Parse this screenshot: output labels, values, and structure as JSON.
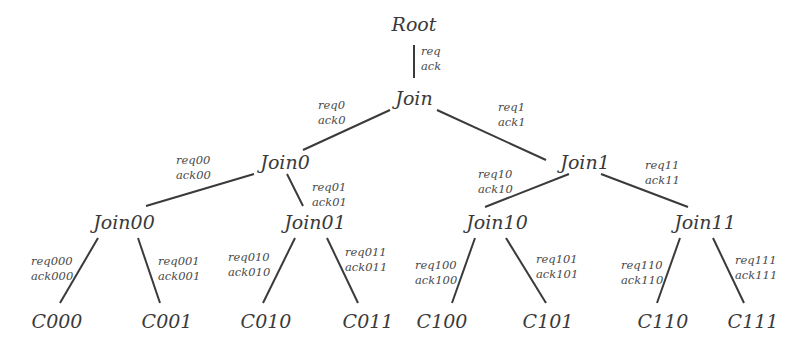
{
  "diagram": {
    "type": "binary-tree",
    "colors": {
      "line": "#3a3a3a",
      "text": "#3a3a3a",
      "label": "#4a4a4a",
      "background": "#ffffff"
    },
    "nodes": [
      {
        "id": "root",
        "label": "Root",
        "x": 414,
        "y": 24
      },
      {
        "id": "join",
        "label": "Join",
        "x": 414,
        "y": 98
      },
      {
        "id": "join0",
        "label": "Join0",
        "x": 285,
        "y": 162
      },
      {
        "id": "join1",
        "label": "Join1",
        "x": 585,
        "y": 162
      },
      {
        "id": "join00",
        "label": "Join00",
        "x": 124,
        "y": 222
      },
      {
        "id": "join01",
        "label": "Join01",
        "x": 315,
        "y": 222
      },
      {
        "id": "join10",
        "label": "Join10",
        "x": 497,
        "y": 222
      },
      {
        "id": "join11",
        "label": "Join11",
        "x": 705,
        "y": 222
      },
      {
        "id": "c000",
        "label": "C000",
        "x": 57,
        "y": 321
      },
      {
        "id": "c001",
        "label": "C001",
        "x": 167,
        "y": 321
      },
      {
        "id": "c010",
        "label": "C010",
        "x": 266,
        "y": 321
      },
      {
        "id": "c011",
        "label": "C011",
        "x": 368,
        "y": 321
      },
      {
        "id": "c100",
        "label": "C100",
        "x": 442,
        "y": 321
      },
      {
        "id": "c101",
        "label": "C101",
        "x": 548,
        "y": 321
      },
      {
        "id": "c110",
        "label": "C110",
        "x": 663,
        "y": 321
      },
      {
        "id": "c111",
        "label": "C111",
        "x": 753,
        "y": 321
      }
    ],
    "edges": [
      {
        "from": "root",
        "to": "join",
        "req": "req",
        "ack": "ack",
        "x1": 414,
        "y1": 45,
        "x2": 414,
        "y2": 78,
        "lx": 421,
        "ly": 44
      },
      {
        "from": "join",
        "to": "join0",
        "req": "req0",
        "ack": "ack0",
        "x1": 390,
        "y1": 110,
        "x2": 303,
        "y2": 150,
        "lx": 318,
        "ly": 98
      },
      {
        "from": "join",
        "to": "join1",
        "req": "req1",
        "ack": "ack1",
        "x1": 437,
        "y1": 110,
        "x2": 546,
        "y2": 160,
        "lx": 498,
        "ly": 100
      },
      {
        "from": "join0",
        "to": "join00",
        "req": "req00",
        "ack": "ack00",
        "x1": 254,
        "y1": 174,
        "x2": 146,
        "y2": 206,
        "lx": 176,
        "ly": 153
      },
      {
        "from": "join0",
        "to": "join01",
        "req": "req01",
        "ack": "ack01",
        "x1": 287,
        "y1": 174,
        "x2": 303,
        "y2": 206,
        "lx": 312,
        "ly": 180
      },
      {
        "from": "join1",
        "to": "join10",
        "req": "req10",
        "ack": "ack10",
        "x1": 569,
        "y1": 174,
        "x2": 485,
        "y2": 207,
        "lx": 478,
        "ly": 167
      },
      {
        "from": "join1",
        "to": "join11",
        "req": "req11",
        "ack": "ack11",
        "x1": 601,
        "y1": 174,
        "x2": 688,
        "y2": 207,
        "lx": 645,
        "ly": 158
      },
      {
        "from": "join00",
        "to": "c000",
        "req": "req000",
        "ack": "ack000",
        "x1": 98,
        "y1": 238,
        "x2": 60,
        "y2": 303,
        "lx": 31,
        "ly": 254
      },
      {
        "from": "join00",
        "to": "c001",
        "req": "req001",
        "ack": "ack001",
        "x1": 138,
        "y1": 238,
        "x2": 160,
        "y2": 303,
        "lx": 158,
        "ly": 254
      },
      {
        "from": "join01",
        "to": "c010",
        "req": "req010",
        "ack": "ack010",
        "x1": 295,
        "y1": 238,
        "x2": 263,
        "y2": 303,
        "lx": 228,
        "ly": 250
      },
      {
        "from": "join01",
        "to": "c011",
        "req": "req011",
        "ack": "ack011",
        "x1": 327,
        "y1": 238,
        "x2": 358,
        "y2": 303,
        "lx": 345,
        "ly": 245
      },
      {
        "from": "join10",
        "to": "c100",
        "req": "req100",
        "ack": "ack100",
        "x1": 475,
        "y1": 238,
        "x2": 452,
        "y2": 303,
        "lx": 415,
        "ly": 258
      },
      {
        "from": "join10",
        "to": "c101",
        "req": "req101",
        "ack": "ack101",
        "x1": 506,
        "y1": 238,
        "x2": 546,
        "y2": 303,
        "lx": 536,
        "ly": 252
      },
      {
        "from": "join11",
        "to": "c110",
        "req": "req110",
        "ack": "ack110",
        "x1": 680,
        "y1": 238,
        "x2": 657,
        "y2": 303,
        "lx": 621,
        "ly": 258
      },
      {
        "from": "join11",
        "to": "c111",
        "req": "req111",
        "ack": "ack111",
        "x1": 713,
        "y1": 238,
        "x2": 744,
        "y2": 303,
        "lx": 735,
        "ly": 253
      }
    ]
  }
}
